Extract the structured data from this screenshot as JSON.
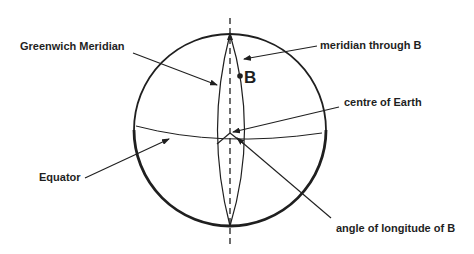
{
  "diagram": {
    "type": "earth-longitude",
    "colors": {
      "ink": "#1f1f1f",
      "background": "#ffffff"
    },
    "labels": {
      "greenwich_meridian": "Greenwich Meridian",
      "meridian_through_b": "meridian through B",
      "point_b": "B",
      "centre_of_earth": "centre of Earth",
      "equator": "Equator",
      "angle_of_longitude": "angle of longitude of B"
    },
    "elements": [
      "Earth sphere outline",
      "polar axis (dashed)",
      "Greenwich Meridian",
      "meridian through B",
      "point B",
      "Equator",
      "centre of Earth",
      "angle of longitude of B"
    ]
  }
}
